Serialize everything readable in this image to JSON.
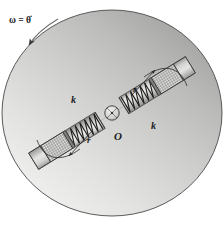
{
  "figure": {
    "labels": {
      "omega": "ω = θ̇",
      "omega_symbol": "ω",
      "equals": "=",
      "theta_dot": "θ̇",
      "center_point": "O",
      "spring_left": "k",
      "spring_right": "k",
      "radius_upper": "r",
      "radius_lower": "r"
    },
    "icons": {
      "rotation_arrow": "curved-arrow-icon",
      "pivot": "pivot-hub-icon",
      "spring": "coil-spring-icon",
      "slider": "hatched-block-icon",
      "dimension_arc": "arc-arrow-icon"
    },
    "colors": {
      "disk_light": "#eeeeec",
      "disk_mid": "#c9c9c7",
      "disk_dark": "#9a9a99",
      "outline": "#3a3a3a",
      "tube_body": "#c0c0be",
      "tube_light": "#e4e4e2",
      "slider_fill": "#b5b5b3",
      "label_color": "#1a1a1a"
    },
    "geometry": {
      "disk_center_x": 112,
      "disk_center_y": 113,
      "disk_radius_x": 110,
      "disk_radius_y": 103,
      "hub_radius": 7
    }
  }
}
